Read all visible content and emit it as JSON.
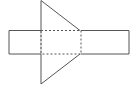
{
  "diagram": {
    "type": "geometric-net",
    "stroke_color": "#555555",
    "background": "#ffffff",
    "shapes": {
      "left_rect": {
        "x1": 9,
        "y1": 30.5,
        "x2": 41,
        "y2": 54
      },
      "center_rect_dashed": {
        "x1": 41,
        "y1": 30.5,
        "x2": 81,
        "y2": 54
      },
      "right_rect": {
        "x1": 81,
        "y1": 30.5,
        "x2": 129,
        "y2": 54
      },
      "top_triangle": [
        [
          41,
          0.5
        ],
        [
          41,
          30.5
        ],
        [
          80,
          30.5
        ]
      ],
      "bottom_triangle": [
        [
          41,
          54
        ],
        [
          41,
          84
        ],
        [
          80,
          54
        ]
      ]
    }
  }
}
